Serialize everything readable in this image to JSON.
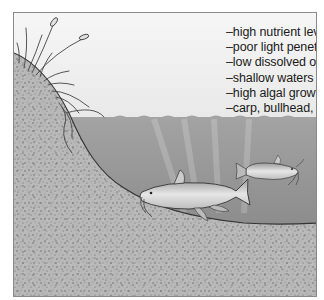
{
  "diagram": {
    "characteristics": [
      "–high nutrient levels",
      "–poor light penetration",
      "–low dissolved oxygen",
      "–shallow waters",
      "–high algal growth",
      "–carp, bullhead, catfish"
    ],
    "elements": {
      "shore": "sandy bank with reeds/cattails",
      "water": "murky gray water with light rays",
      "fish": [
        "carp",
        "catfish"
      ],
      "sediment": "speckled lake bottom"
    }
  },
  "colors": {
    "sky": "#f4f4f4",
    "water_top": "#9a9a9a",
    "water_bottom": "#8a8a8a",
    "sediment": "#b5b5b5",
    "outline": "#333333",
    "fish_body": "#d8d8d8"
  }
}
